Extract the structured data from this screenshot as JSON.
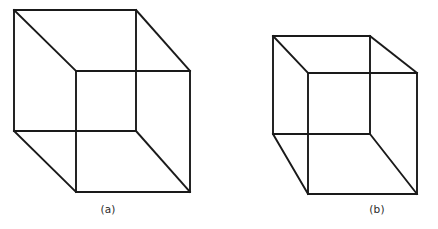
{
  "figure": {
    "kind": "line-drawing",
    "background_color": "#ffffff",
    "stroke_color": "#1a1a1a",
    "stroke_width": 1.9,
    "width": 438,
    "height": 229
  },
  "panels": [
    {
      "id": "a",
      "label": "(a)",
      "label_x": 108,
      "label_y": 203,
      "front_face": {
        "x": 76,
        "y": 71,
        "w": 114,
        "h": 121
      },
      "back_face": {
        "x": 14,
        "y": 10,
        "w": 122,
        "h": 121
      },
      "front_points": "76,71 190,71 190,192 76,192",
      "back_points": "14,10 136,10 136,131 14,131",
      "connectors": [
        {
          "x1": 14,
          "y1": 10,
          "x2": 76,
          "y2": 71
        },
        {
          "x1": 136,
          "y1": 10,
          "x2": 190,
          "y2": 71
        },
        {
          "x1": 136,
          "y1": 131,
          "x2": 190,
          "y2": 192
        },
        {
          "x1": 14,
          "y1": 131,
          "x2": 76,
          "y2": 192
        }
      ]
    },
    {
      "id": "b",
      "label": "(b)",
      "label_x": 377,
      "label_y": 203,
      "front_face": {
        "x": 308,
        "y": 73,
        "w": 109,
        "h": 121
      },
      "back_face": {
        "x": 273,
        "y": 36,
        "w": 97,
        "h": 98
      },
      "front_points": "308,73 417,73 417,194 308,194",
      "back_points": "273,36 370,36 370,134 273,134",
      "connectors": [
        {
          "x1": 273,
          "y1": 36,
          "x2": 308,
          "y2": 73
        },
        {
          "x1": 370,
          "y1": 36,
          "x2": 417,
          "y2": 73
        },
        {
          "x1": 370,
          "y1": 134,
          "x2": 417,
          "y2": 194
        },
        {
          "x1": 273,
          "y1": 134,
          "x2": 308,
          "y2": 194
        }
      ]
    }
  ]
}
